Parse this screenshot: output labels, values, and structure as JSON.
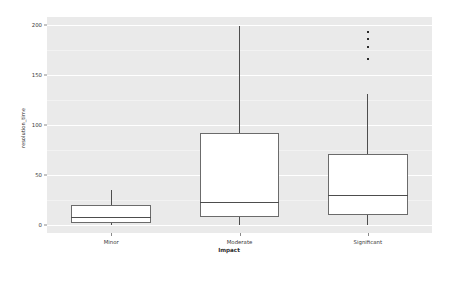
{
  "chart_data": {
    "type": "box",
    "title": "",
    "xlabel": "Impact",
    "ylabel": "resolution_time",
    "categories": [
      "Minor",
      "Moderate",
      "Significant"
    ],
    "ylim": [
      -8,
      208
    ],
    "yticks": [
      0,
      50,
      100,
      150,
      200
    ],
    "ytick_labels": [
      "0",
      "50",
      "100",
      "150",
      "200"
    ],
    "grid": true,
    "grid_color": "#ffffff",
    "plot_background": "#eaeaea",
    "figure_background": "#ffffff",
    "box_facecolor": "#ffffff",
    "box_edgecolor": "#6b6b6b",
    "median_color": "#4d4d4d",
    "whisker_color": "#4d4d4d",
    "flier_color": "#2b2b2b",
    "legend": null,
    "boxes": [
      {
        "category": "Minor",
        "whisker_low": 0,
        "q1": 2,
        "median": 8,
        "q3": 20,
        "whisker_high": 35,
        "outliers": []
      },
      {
        "category": "Moderate",
        "whisker_low": 0,
        "q1": 8,
        "median": 23,
        "q3": 92,
        "whisker_high": 199,
        "outliers": []
      },
      {
        "category": "Significant",
        "whisker_low": 0,
        "q1": 10,
        "median": 30,
        "q3": 71,
        "whisker_high": 131,
        "outliers": [
          166,
          178,
          186,
          193
        ]
      }
    ]
  },
  "axes": {
    "ylabel": "resolution_time",
    "xlabel": "Impact",
    "ytick_labels": [
      "0",
      "50",
      "100",
      "150",
      "200"
    ],
    "xtick_labels": [
      "Minor",
      "Moderate",
      "Significant"
    ]
  }
}
